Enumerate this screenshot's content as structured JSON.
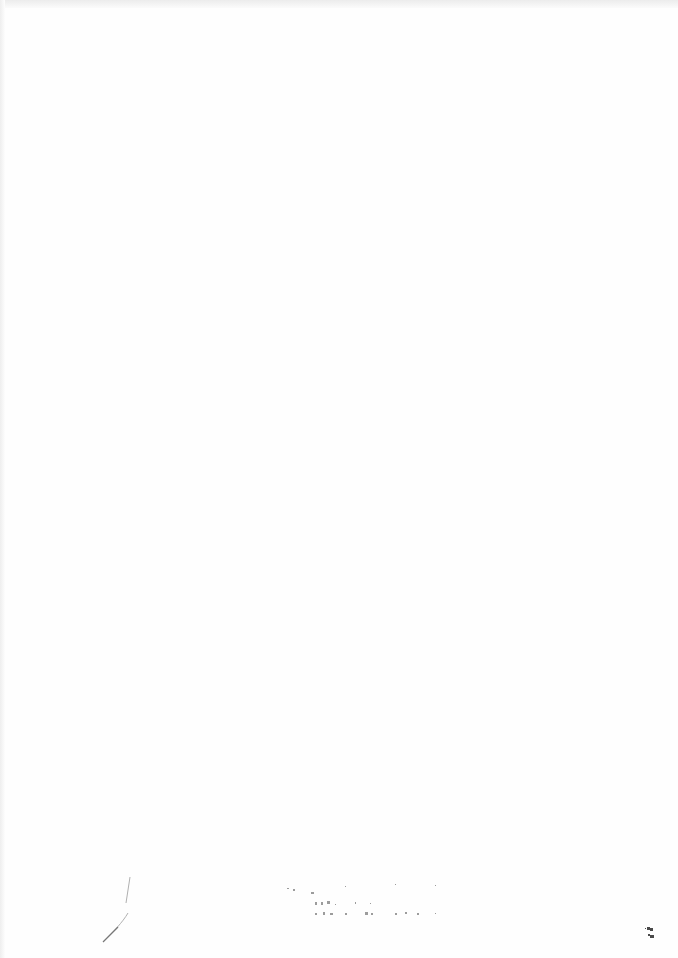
{
  "document": {
    "type": "scanned-page",
    "body_text": "",
    "stamp": {
      "legible": false,
      "lines": [
        "",
        "",
        ""
      ]
    },
    "corner_mark": {
      "legible": false,
      "text": ""
    }
  }
}
